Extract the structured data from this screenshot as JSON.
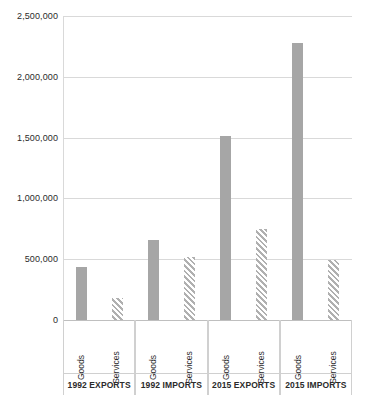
{
  "chart_data": {
    "type": "bar",
    "title": "",
    "subtitle": "",
    "xlabel": "",
    "ylabel": "",
    "ylim": [
      0,
      2500000
    ],
    "grid": true,
    "legend_position": "none",
    "categories": [
      "1992 EXPORTS",
      "1992 IMPORTS",
      "2015 EXPORTS",
      "2015 IMPORTS"
    ],
    "subcategories": [
      "Goods",
      "Services"
    ],
    "series": [
      {
        "name": "Goods",
        "style": "solid-gray",
        "color": "#a6a6a6",
        "values": [
          440000,
          655000,
          1510000,
          2275000
        ]
      },
      {
        "name": "Services",
        "style": "diagonal-hatch",
        "color": "#b0b0b0",
        "values": [
          180000,
          520000,
          750000,
          490000
        ]
      }
    ],
    "y_ticks": [
      0,
      500000,
      1000000,
      1500000,
      2000000,
      2500000
    ],
    "y_tick_labels": [
      "0",
      "500,000",
      "1,000,000",
      "1,500,000",
      "2,000,000",
      "2,500,000"
    ]
  },
  "axis": {
    "y_tick_labels": [
      "2,500,000",
      "2,000,000",
      "1,500,000",
      "1,000,000",
      "500,000",
      "0"
    ]
  },
  "groups": [
    {
      "label": "1992 EXPORTS",
      "bars": [
        {
          "series": "Goods",
          "label": "Goods",
          "value": 440000
        },
        {
          "series": "Services",
          "label": "Services",
          "value": 180000
        }
      ]
    },
    {
      "label": "1992 IMPORTS",
      "bars": [
        {
          "series": "Goods",
          "label": "Goods",
          "value": 655000
        },
        {
          "series": "Services",
          "label": "Services",
          "value": 520000
        }
      ]
    },
    {
      "label": "2015 EXPORTS",
      "bars": [
        {
          "series": "Goods",
          "label": "Goods",
          "value": 1510000
        },
        {
          "series": "Services",
          "label": "Services",
          "value": 750000
        }
      ]
    },
    {
      "label": "2015 IMPORTS",
      "bars": [
        {
          "series": "Goods",
          "label": "Goods",
          "value": 2275000
        },
        {
          "series": "Services",
          "label": "Services",
          "value": 490000
        }
      ]
    }
  ]
}
